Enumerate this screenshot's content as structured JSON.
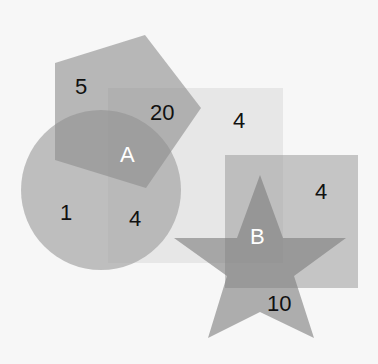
{
  "diagram": {
    "type": "overlapping-shapes",
    "shapes": [
      {
        "name": "large-square",
        "fill": "#e6e6e6"
      },
      {
        "name": "circle",
        "fill": "#b4b4b4"
      },
      {
        "name": "pentagon",
        "fill": "#a8a8a8"
      },
      {
        "name": "square-a",
        "fill": "#9a9a9a"
      },
      {
        "name": "square-b",
        "fill": "#b8b8b8"
      },
      {
        "name": "star",
        "fill": "#8e8e8e"
      }
    ],
    "labels": {
      "pentagon_only": "5",
      "pentagon_square": "20",
      "large_square_only": "4",
      "circle_only": "1",
      "circle_square": "4",
      "intersection_a": "A",
      "square_b_only": "4",
      "intersection_b": "B",
      "star_only": "10"
    }
  }
}
